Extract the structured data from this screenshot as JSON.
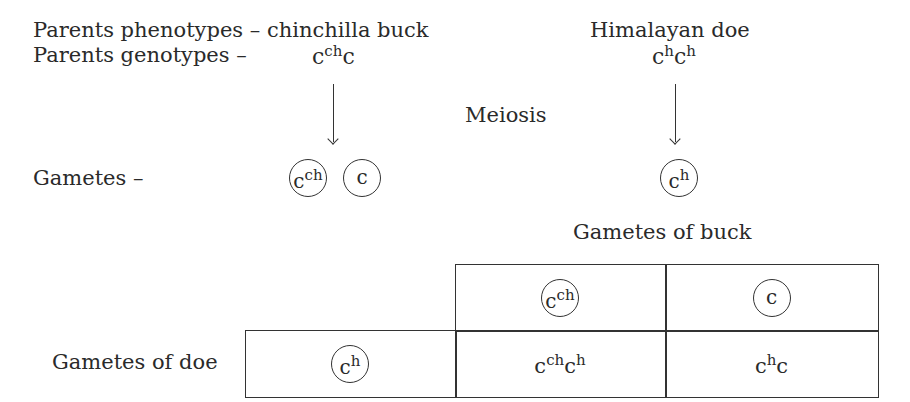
{
  "header": {
    "phenotypes_label": "Parents phenotypes – chinchilla buck",
    "doe_phenotype": "Himalayan doe",
    "genotypes_label": "Parents genotypes –"
  },
  "buck": {
    "genotype": {
      "a_base": "c",
      "a_sup": "ch",
      "b_base": "c",
      "b_sup": ""
    },
    "gametes": [
      {
        "base": "c",
        "sup": "ch"
      },
      {
        "base": "c",
        "sup": ""
      }
    ]
  },
  "doe": {
    "genotype": {
      "a_base": "c",
      "a_sup": "h",
      "b_base": "c",
      "b_sup": "h"
    },
    "gametes": [
      {
        "base": "c",
        "sup": "h"
      }
    ]
  },
  "process_label": "Meiosis",
  "gametes_label": "Gametes –",
  "punnett": {
    "column_header_label": "Gametes of buck",
    "row_header_label": "Gametes of doe",
    "columns": [
      {
        "base": "c",
        "sup": "ch"
      },
      {
        "base": "c",
        "sup": ""
      }
    ],
    "rows": [
      {
        "gamete": {
          "base": "c",
          "sup": "h"
        },
        "offspring": [
          {
            "a_base": "c",
            "a_sup": "ch",
            "b_base": "c",
            "b_sup": "h"
          },
          {
            "a_base": "c",
            "a_sup": "h",
            "b_base": "c",
            "b_sup": ""
          }
        ]
      }
    ]
  },
  "colors": {
    "ink": "#2a2a2a",
    "lines": "#333333",
    "background": "#ffffff"
  }
}
